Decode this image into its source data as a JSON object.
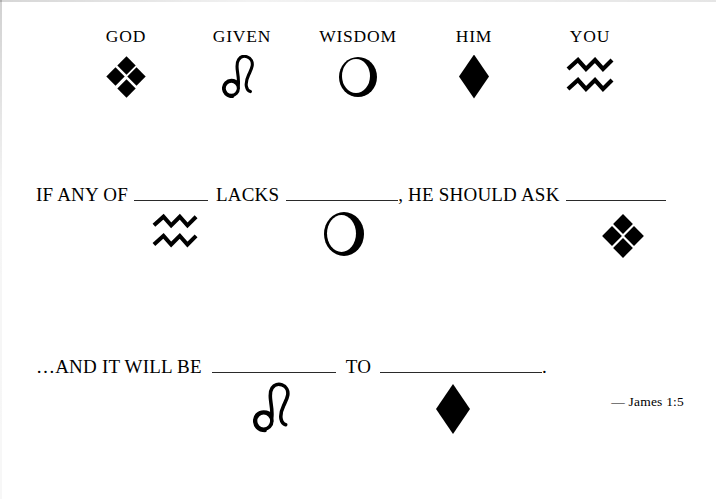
{
  "document": {
    "type": "scripture-fill-in-the-blank-worksheet",
    "citation": "— James 1:5"
  },
  "legend": {
    "items": [
      {
        "label": "GOD",
        "symbol": "four-diamond-cluster",
        "symbol_unicode": "❖"
      },
      {
        "label": "GIVEN",
        "symbol": "leo-zodiac",
        "symbol_unicode": "♌"
      },
      {
        "label": "WISDOM",
        "symbol": "eclipse-crescent",
        "symbol_unicode": "◐"
      },
      {
        "label": "HIM",
        "symbol": "solid-diamond",
        "symbol_unicode": "◆"
      },
      {
        "label": "YOU",
        "symbol": "aquarius-waves",
        "symbol_unicode": "♒"
      }
    ]
  },
  "verse": {
    "line1": {
      "seg1": "IF ANY OF",
      "seg2": "LACKS",
      "seg3": ", HE SHOULD ASK",
      "answers": [
        {
          "symbol": "aquarius-waves",
          "word": "YOU"
        },
        {
          "symbol": "eclipse-crescent",
          "word": "WISDOM"
        },
        {
          "symbol": "four-diamond-cluster",
          "word": "GOD"
        }
      ]
    },
    "line2": {
      "seg1": "…AND IT WILL BE",
      "seg2": "TO",
      "seg3": ".",
      "answers": [
        {
          "symbol": "leo-zodiac",
          "word": "GIVEN"
        },
        {
          "symbol": "solid-diamond",
          "word": "HIM"
        }
      ]
    }
  },
  "colors": {
    "ink": "#000000",
    "paper": "#ffffff",
    "rule": "#2a2a2a"
  }
}
